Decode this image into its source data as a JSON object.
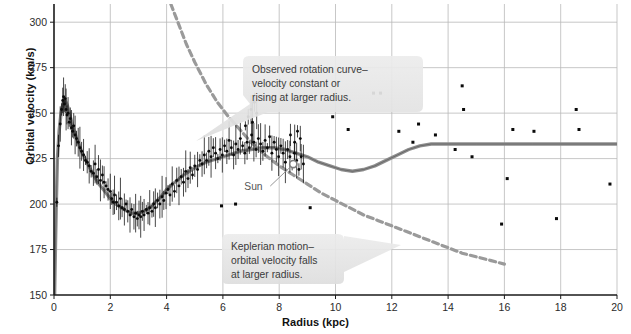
{
  "figure": {
    "title": "",
    "xlabel": "Radius (kpc)",
    "ylabel": "Orbital velocity (km/s)"
  },
  "annotations": {
    "observed": {
      "name": "observed-rotation-curve-callout",
      "line1": "Observed rotation curve–",
      "line2": "velocity constant or",
      "line3": "rising at larger radius."
    },
    "keplerian": {
      "name": "keplerian-motion-callout",
      "line1": "Keplerian motion–",
      "line2": "orbital velocity falls",
      "line3": "at larger radius."
    },
    "sun": {
      "label": "Sun",
      "radius_kpc": 8.5,
      "velocity_kms": 222
    }
  },
  "colors": {
    "axis": "#1a1a1a",
    "grid": "#b9b9b9",
    "observed_curve": "#8d8d8d",
    "keplerian_dashed": "#9a9a9a",
    "data_point": "#0a0a0a",
    "callout_fill": "#e4e4e4",
    "text": "#2b2b2b"
  },
  "chart_data": {
    "type": "scatter",
    "title": "",
    "xlabel": "Radius (kpc)",
    "ylabel": "Orbital velocity (km/s)",
    "xlim": [
      0,
      20
    ],
    "ylim": [
      150,
      310
    ],
    "xticks": [
      0,
      2,
      4,
      6,
      8,
      10,
      12,
      14,
      16,
      18,
      20
    ],
    "yticks": [
      150,
      175,
      200,
      225,
      250,
      275,
      300
    ],
    "grid": true,
    "legend": "none",
    "series": [
      {
        "name": "Observed rotation curve (model)",
        "type": "line",
        "style": "solid",
        "color": "#8d8d8d",
        "points": [
          [
            0.02,
            150
          ],
          [
            0.05,
            175
          ],
          [
            0.08,
            200
          ],
          [
            0.12,
            225
          ],
          [
            0.18,
            240
          ],
          [
            0.25,
            250
          ],
          [
            0.33,
            256
          ],
          [
            0.4,
            257
          ],
          [
            0.48,
            254
          ],
          [
            0.58,
            248
          ],
          [
            0.7,
            241
          ],
          [
            0.85,
            234
          ],
          [
            1.0,
            228
          ],
          [
            1.2,
            222
          ],
          [
            1.4,
            216
          ],
          [
            1.6,
            211
          ],
          [
            1.8,
            207
          ],
          [
            2.0,
            203
          ],
          [
            2.2,
            200
          ],
          [
            2.4,
            198
          ],
          [
            2.6,
            196
          ],
          [
            2.8,
            195
          ],
          [
            3.0,
            195
          ],
          [
            3.2,
            196
          ],
          [
            3.4,
            198
          ],
          [
            3.6,
            201
          ],
          [
            3.8,
            204
          ],
          [
            4.0,
            208
          ],
          [
            4.3,
            212
          ],
          [
            4.6,
            216
          ],
          [
            5.0,
            220
          ],
          [
            5.4,
            223
          ],
          [
            5.8,
            225
          ],
          [
            6.2,
            227
          ],
          [
            6.6,
            229
          ],
          [
            7.0,
            230
          ],
          [
            7.4,
            231
          ],
          [
            7.8,
            231
          ],
          [
            8.2,
            230
          ],
          [
            8.6,
            228
          ],
          [
            9.0,
            226
          ],
          [
            9.4,
            223
          ],
          [
            9.8,
            221
          ],
          [
            10.2,
            219
          ],
          [
            10.6,
            218
          ],
          [
            11.0,
            219
          ],
          [
            11.4,
            221
          ],
          [
            11.8,
            224
          ],
          [
            12.2,
            227
          ],
          [
            12.6,
            230
          ],
          [
            13.0,
            232
          ],
          [
            13.4,
            233
          ],
          [
            14.0,
            233
          ],
          [
            15.0,
            233
          ],
          [
            16.0,
            233
          ],
          [
            17.0,
            233
          ],
          [
            18.0,
            233
          ],
          [
            19.0,
            233
          ],
          [
            20.0,
            233
          ]
        ]
      },
      {
        "name": "Keplerian motion",
        "type": "line",
        "style": "dashed",
        "color": "#9a9a9a",
        "points": [
          [
            4.15,
            310
          ],
          [
            4.4,
            300
          ],
          [
            4.7,
            288
          ],
          [
            5.0,
            278
          ],
          [
            5.4,
            266
          ],
          [
            5.8,
            256
          ],
          [
            6.2,
            248
          ],
          [
            6.6,
            241
          ],
          [
            7.0,
            234
          ],
          [
            7.5,
            227
          ],
          [
            8.0,
            221
          ],
          [
            8.5,
            216
          ],
          [
            9.0,
            211
          ],
          [
            9.5,
            206
          ],
          [
            10.0,
            202
          ],
          [
            10.5,
            198
          ],
          [
            11.0,
            194
          ],
          [
            11.5,
            191
          ],
          [
            12.0,
            188
          ],
          [
            12.5,
            185
          ],
          [
            13.0,
            182
          ],
          [
            13.5,
            179
          ],
          [
            14.0,
            176
          ],
          [
            14.5,
            173
          ],
          [
            15.0,
            171
          ],
          [
            15.5,
            169
          ],
          [
            16.0,
            167
          ]
        ]
      },
      {
        "name": "Inner disk measurements (dense, with error bars)",
        "type": "scatter",
        "color": "#0a0a0a",
        "points": [
          [
            0.1,
            201
          ],
          [
            0.16,
            232
          ],
          [
            0.22,
            244
          ],
          [
            0.27,
            252
          ],
          [
            0.31,
            257
          ],
          [
            0.34,
            259
          ],
          [
            0.37,
            255
          ],
          [
            0.4,
            258
          ],
          [
            0.43,
            252
          ],
          [
            0.46,
            249
          ],
          [
            0.5,
            250
          ],
          [
            0.54,
            245
          ],
          [
            0.58,
            247
          ],
          [
            0.62,
            242
          ],
          [
            0.66,
            240
          ],
          [
            0.7,
            243
          ],
          [
            0.75,
            238
          ],
          [
            0.8,
            236
          ],
          [
            0.86,
            234
          ],
          [
            0.92,
            231
          ],
          [
            0.98,
            229
          ],
          [
            1.05,
            227
          ],
          [
            1.12,
            224
          ],
          [
            1.18,
            223
          ],
          [
            1.25,
            221
          ],
          [
            1.32,
            218
          ],
          [
            1.4,
            217
          ],
          [
            1.46,
            222
          ],
          [
            1.52,
            215
          ],
          [
            1.58,
            219
          ],
          [
            1.65,
            213
          ],
          [
            1.72,
            216
          ],
          [
            1.78,
            212
          ],
          [
            1.85,
            210
          ],
          [
            1.92,
            208
          ],
          [
            2.0,
            207
          ],
          [
            2.05,
            203
          ],
          [
            2.1,
            201
          ],
          [
            2.15,
            205
          ],
          [
            2.22,
            201
          ],
          [
            2.3,
            199
          ],
          [
            2.36,
            203
          ],
          [
            2.42,
            198
          ],
          [
            2.5,
            197
          ],
          [
            2.56,
            200
          ],
          [
            2.62,
            196
          ],
          [
            2.7,
            194
          ],
          [
            2.76,
            197
          ],
          [
            2.84,
            193
          ],
          [
            2.9,
            195
          ],
          [
            2.96,
            192
          ],
          [
            3.02,
            194
          ],
          [
            3.08,
            193
          ],
          [
            3.14,
            196
          ],
          [
            3.2,
            194
          ],
          [
            3.28,
            197
          ],
          [
            3.34,
            195
          ],
          [
            3.4,
            198
          ],
          [
            3.48,
            196
          ],
          [
            3.54,
            200
          ],
          [
            3.6,
            198
          ],
          [
            3.68,
            202
          ],
          [
            3.76,
            200
          ],
          [
            3.84,
            204
          ],
          [
            3.9,
            202
          ],
          [
            3.98,
            206
          ],
          [
            4.05,
            208
          ],
          [
            4.12,
            205
          ],
          [
            4.2,
            211
          ],
          [
            4.28,
            207
          ],
          [
            4.36,
            213
          ],
          [
            4.44,
            210
          ],
          [
            4.52,
            215
          ],
          [
            4.6,
            212
          ],
          [
            4.68,
            218
          ],
          [
            4.76,
            214
          ],
          [
            4.84,
            220
          ],
          [
            4.92,
            216
          ],
          [
            5.0,
            221
          ],
          [
            5.1,
            219
          ],
          [
            5.18,
            224
          ],
          [
            5.26,
            222
          ],
          [
            5.34,
            227
          ],
          [
            5.42,
            224
          ],
          [
            5.5,
            229
          ],
          [
            5.58,
            226
          ],
          [
            5.66,
            231
          ],
          [
            5.74,
            228
          ],
          [
            5.82,
            225
          ],
          [
            5.9,
            230
          ],
          [
            5.98,
            227
          ],
          [
            6.06,
            232
          ],
          [
            6.14,
            229
          ],
          [
            6.22,
            235
          ],
          [
            6.3,
            231
          ],
          [
            6.38,
            227
          ],
          [
            6.46,
            233
          ],
          [
            6.54,
            230
          ],
          [
            6.62,
            236
          ],
          [
            6.7,
            232
          ],
          [
            6.78,
            228
          ],
          [
            6.86,
            234
          ],
          [
            6.94,
            231
          ],
          [
            7.02,
            238
          ],
          [
            7.1,
            234
          ],
          [
            7.18,
            230
          ],
          [
            7.26,
            236
          ],
          [
            7.34,
            233
          ],
          [
            7.42,
            229
          ],
          [
            7.5,
            235
          ],
          [
            7.58,
            231
          ],
          [
            7.66,
            237
          ],
          [
            7.74,
            228
          ],
          [
            7.82,
            234
          ],
          [
            7.9,
            230
          ],
          [
            7.98,
            226
          ],
          [
            8.06,
            232
          ],
          [
            8.14,
            228
          ],
          [
            8.22,
            223
          ],
          [
            8.3,
            230
          ],
          [
            8.38,
            226
          ],
          [
            8.46,
            221
          ],
          [
            8.54,
            228
          ],
          [
            8.62,
            224
          ],
          [
            8.7,
            219
          ],
          [
            8.78,
            226
          ],
          [
            8.86,
            222
          ],
          [
            6.9,
            248
          ],
          [
            7.0,
            252
          ],
          [
            7.05,
            245
          ],
          [
            7.12,
            256
          ],
          [
            7.2,
            250
          ],
          [
            6.8,
            243
          ],
          [
            8.4,
            238
          ],
          [
            8.55,
            234
          ],
          [
            8.65,
            240
          ],
          [
            8.75,
            236
          ]
        ]
      },
      {
        "name": "Outer galaxy measurements (sparse)",
        "type": "scatter",
        "color": "#0a0a0a",
        "points": [
          [
            5.95,
            199
          ],
          [
            6.45,
            200
          ],
          [
            9.1,
            198
          ],
          [
            9.9,
            248
          ],
          [
            10.45,
            241
          ],
          [
            11.35,
            261
          ],
          [
            11.6,
            261
          ],
          [
            12.25,
            240
          ],
          [
            12.75,
            234
          ],
          [
            12.95,
            244
          ],
          [
            13.55,
            238
          ],
          [
            14.25,
            230
          ],
          [
            14.5,
            265
          ],
          [
            14.55,
            252
          ],
          [
            14.85,
            226
          ],
          [
            15.9,
            189
          ],
          [
            16.1,
            214
          ],
          [
            16.3,
            241
          ],
          [
            17.05,
            240
          ],
          [
            17.85,
            192
          ],
          [
            18.55,
            252
          ],
          [
            18.65,
            241
          ],
          [
            19.75,
            211
          ]
        ]
      }
    ]
  }
}
